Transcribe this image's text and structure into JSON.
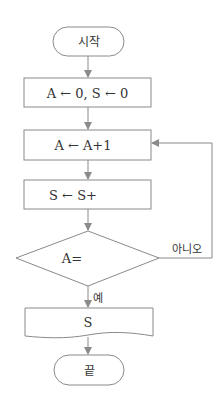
{
  "flowchart": {
    "start": {
      "label": "시작"
    },
    "init": {
      "label": "A ← 0, S ← 0"
    },
    "increment": {
      "label": "A ← A+1"
    },
    "accumulate": {
      "label": "S ← S+"
    },
    "decision": {
      "label": "A=",
      "yes_label": "예",
      "no_label": "아니오"
    },
    "output": {
      "label": "S"
    },
    "end": {
      "label": "끝"
    }
  },
  "colors": {
    "stroke": "#8a8a8a",
    "text": "#333333"
  }
}
